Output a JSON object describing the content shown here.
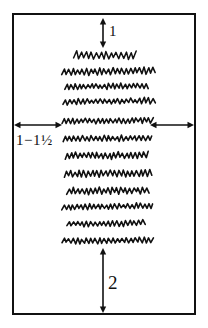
{
  "diagram": {
    "ink_color": "#111111",
    "background_color": "#ffffff",
    "page_frame": {
      "name": "page-outline",
      "x": 12,
      "y": 13,
      "width": 184,
      "height": 302,
      "stroke_width": 2
    },
    "annotations": [
      {
        "id": "top-margin",
        "label": "1",
        "orientation": "vertical",
        "meaning": "top margin measured in inches",
        "x": 103,
        "y1": 18,
        "y2": 48
      },
      {
        "id": "left-margin",
        "label": "1−1½",
        "label_parts": {
          "whole_low": "1",
          "dash": "−",
          "whole_high": "1",
          "fraction": "½"
        },
        "orientation": "horizontal",
        "meaning": "left and right side margins measured in inches",
        "y": 125,
        "x1": 14,
        "x2": 62
      },
      {
        "id": "right-margin",
        "label": "",
        "orientation": "horizontal",
        "meaning": "right side margin measured in inches",
        "y": 125,
        "x1": 150,
        "x2": 194
      },
      {
        "id": "bottom-margin",
        "label": "2",
        "orientation": "vertical",
        "meaning": "bottom margin measured in inches",
        "x": 103,
        "y1": 248,
        "y2": 313
      }
    ],
    "text_lines": [
      {
        "index": 1,
        "kind": "title-line",
        "x": 74,
        "y": 55,
        "width": 62,
        "amplitude": 7,
        "period": 5.0,
        "tilt": 0
      },
      {
        "index": 2,
        "kind": "body-line",
        "x": 62,
        "y": 72,
        "width": 93,
        "amplitude": 6,
        "period": 4.4,
        "tilt": -1.5
      },
      {
        "index": 3,
        "kind": "body-line",
        "x": 65,
        "y": 87,
        "width": 83,
        "amplitude": 5,
        "period": 4.2,
        "tilt": -1.2
      },
      {
        "index": 4,
        "kind": "body-line",
        "x": 63,
        "y": 102,
        "width": 92,
        "amplitude": 5,
        "period": 4.4,
        "tilt": -1.5
      },
      {
        "index": 5,
        "kind": "body-line",
        "x": 62,
        "y": 121,
        "width": 91,
        "amplitude": 5,
        "period": 4.2,
        "tilt": -0.8
      },
      {
        "index": 6,
        "kind": "body-line",
        "x": 63,
        "y": 139,
        "width": 89,
        "amplitude": 5,
        "period": 4.3,
        "tilt": -1.0
      },
      {
        "index": 7,
        "kind": "body-line",
        "x": 65,
        "y": 156,
        "width": 83,
        "amplitude": 6,
        "period": 4.3,
        "tilt": -0.9
      },
      {
        "index": 8,
        "kind": "body-line",
        "x": 64,
        "y": 174,
        "width": 88,
        "amplitude": 6,
        "period": 4.4,
        "tilt": -1.2
      },
      {
        "index": 9,
        "kind": "body-line",
        "x": 67,
        "y": 191,
        "width": 82,
        "amplitude": 6,
        "period": 4.3,
        "tilt": -1.0
      },
      {
        "index": 10,
        "kind": "body-line",
        "x": 62,
        "y": 207,
        "width": 91,
        "amplitude": 5,
        "period": 4.2,
        "tilt": -1.0
      },
      {
        "index": 11,
        "kind": "body-line",
        "x": 67,
        "y": 224,
        "width": 78,
        "amplitude": 5,
        "period": 4.3,
        "tilt": -1.0
      },
      {
        "index": 12,
        "kind": "body-line",
        "x": 62,
        "y": 241,
        "width": 91,
        "amplitude": 5,
        "period": 4.4,
        "tilt": -0.6
      }
    ]
  }
}
